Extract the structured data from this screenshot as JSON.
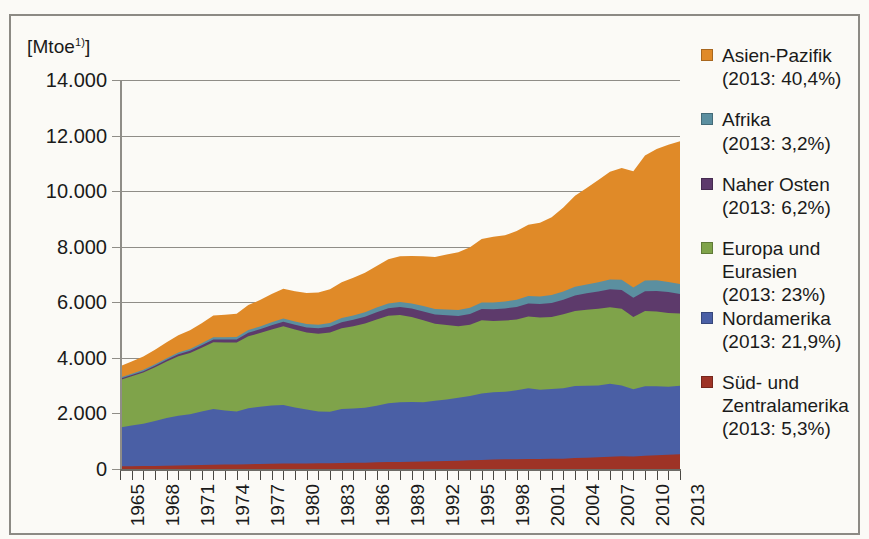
{
  "figure": {
    "unit_label": "[Mtoe",
    "unit_footnote": "1)",
    "unit_label_close": "]"
  },
  "legend": {
    "entries": [
      {
        "name": "Asien-Pazifik",
        "share": "(2013: 40,4%)",
        "color": "#E08A28",
        "gap_after": true
      },
      {
        "name": "Afrika",
        "share": "(2013: 3,2%)",
        "color": "#5B8FA0",
        "gap_after": true
      },
      {
        "name": "Naher Osten",
        "share": "(2013: 6,2%)",
        "color": "#5D3A6B",
        "gap_after": true
      },
      {
        "name": "Europa und Eurasien",
        "share": "(2013: 23%)",
        "color": "#7FA34A",
        "gap_after": false
      },
      {
        "name": "Nordamerika",
        "share": "(2013: 21,9%)",
        "color": "#4A5FA5",
        "gap_after": true
      },
      {
        "name": "Süd- und Zentralamerika",
        "share": "(2013: 5,3%)",
        "color": "#9E3326",
        "gap_after": false
      }
    ]
  },
  "chart_data": {
    "type": "area",
    "stacked": true,
    "title": "",
    "xlabel": "",
    "ylabel": "[Mtoe1)]",
    "ylim": [
      0,
      14000
    ],
    "ytick_labels": [
      "14.000",
      "12.000",
      "10.000",
      "8.000",
      "6.000",
      "4.000",
      "2.000",
      "0"
    ],
    "ytick_values": [
      14000,
      12000,
      10000,
      8000,
      6000,
      4000,
      2000,
      0
    ],
    "grid": true,
    "legend_position": "right",
    "x": [
      1965,
      1966,
      1967,
      1968,
      1969,
      1970,
      1971,
      1972,
      1973,
      1974,
      1975,
      1976,
      1977,
      1978,
      1979,
      1980,
      1981,
      1982,
      1983,
      1984,
      1985,
      1986,
      1987,
      1988,
      1989,
      1990,
      1991,
      1992,
      1993,
      1994,
      1995,
      1996,
      1997,
      1998,
      1999,
      2000,
      2001,
      2002,
      2003,
      2004,
      2005,
      2006,
      2007,
      2008,
      2009,
      2010,
      2011,
      2012,
      2013
    ],
    "xtick_labels": [
      "1965",
      "1968",
      "1971",
      "1974",
      "1977",
      "1980",
      "1983",
      "1986",
      "1989",
      "1992",
      "1995",
      "1998",
      "2001",
      "2004",
      "2007",
      "2010",
      "2013"
    ],
    "series": [
      {
        "name": "Süd- und Zentralamerika",
        "color": "#9E3326",
        "values": [
          95,
          100,
          106,
          112,
          119,
          127,
          134,
          142,
          152,
          158,
          163,
          173,
          181,
          190,
          199,
          200,
          202,
          205,
          207,
          216,
          222,
          229,
          239,
          249,
          256,
          262,
          268,
          276,
          286,
          298,
          311,
          325,
          341,
          349,
          352,
          362,
          363,
          366,
          372,
          392,
          408,
          424,
          441,
          456,
          450,
          479,
          496,
          513,
          527
        ]
      },
      {
        "name": "Nordamerika",
        "color": "#4A5FA5",
        "values": [
          1400,
          1463,
          1526,
          1619,
          1716,
          1793,
          1834,
          1926,
          2006,
          1948,
          1905,
          2010,
          2058,
          2097,
          2108,
          2013,
          1942,
          1866,
          1857,
          1944,
          1958,
          1975,
          2040,
          2117,
          2150,
          2145,
          2137,
          2178,
          2216,
          2269,
          2313,
          2389,
          2425,
          2431,
          2479,
          2546,
          2490,
          2512,
          2537,
          2595,
          2592,
          2579,
          2626,
          2553,
          2418,
          2502,
          2483,
          2450,
          2468
        ]
      },
      {
        "name": "Europa und Eurasien",
        "color": "#7FA34A",
        "values": [
          1710,
          1775,
          1838,
          1930,
          2032,
          2137,
          2210,
          2300,
          2406,
          2450,
          2483,
          2595,
          2652,
          2737,
          2832,
          2805,
          2768,
          2800,
          2847,
          2906,
          2962,
          3032,
          3105,
          3145,
          3135,
          3062,
          2945,
          2771,
          2682,
          2574,
          2571,
          2641,
          2564,
          2560,
          2546,
          2580,
          2595,
          2593,
          2656,
          2703,
          2732,
          2766,
          2756,
          2761,
          2603,
          2705,
          2690,
          2655,
          2600
        ]
      },
      {
        "name": "Naher Osten",
        "color": "#5D3A6B",
        "values": [
          42,
          46,
          51,
          56,
          62,
          69,
          76,
          84,
          94,
          102,
          112,
          125,
          137,
          150,
          163,
          172,
          181,
          192,
          205,
          219,
          232,
          245,
          258,
          272,
          287,
          303,
          318,
          334,
          350,
          366,
          383,
          402,
          420,
          438,
          455,
          472,
          489,
          507,
          528,
          558,
          589,
          615,
          645,
          675,
          690,
          714,
          735,
          752,
          700
        ]
      },
      {
        "name": "Afrika",
        "color": "#5B8FA0",
        "values": [
          45,
          48,
          51,
          55,
          59,
          64,
          69,
          74,
          80,
          85,
          90,
          96,
          102,
          109,
          115,
          121,
          127,
          133,
          140,
          146,
          153,
          160,
          167,
          174,
          181,
          188,
          195,
          202,
          209,
          216,
          224,
          232,
          241,
          249,
          257,
          266,
          275,
          285,
          295,
          309,
          322,
          336,
          350,
          364,
          372,
          386,
          392,
          362,
          362
        ]
      },
      {
        "name": "Asien-Pazifik",
        "color": "#E08A28",
        "values": [
          405,
          440,
          478,
          522,
          572,
          628,
          672,
          724,
          790,
          805,
          832,
          900,
          950,
          1015,
          1070,
          1085,
          1110,
          1155,
          1215,
          1290,
          1355,
          1420,
          1495,
          1590,
          1650,
          1710,
          1790,
          1870,
          1975,
          2080,
          2180,
          2290,
          2370,
          2385,
          2480,
          2560,
          2650,
          2800,
          3020,
          3280,
          3470,
          3680,
          3880,
          4020,
          4180,
          4500,
          4720,
          4940,
          5140
        ]
      }
    ]
  }
}
